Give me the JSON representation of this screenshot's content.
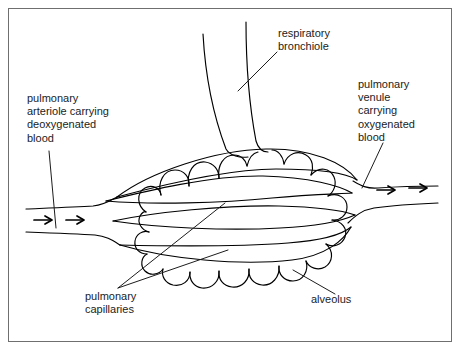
{
  "figure": {
    "style": "hand-drawn line diagram",
    "line_color": "#000000",
    "border_color": "#6f6f6f",
    "background_color": "#ffffff",
    "text_color": "#1c1c1c"
  },
  "labels": {
    "arteriole": "pulmonary\narteriole carrying\ndeoxygenated\nblood",
    "bronchiole": "respiratory\nbronchiole",
    "venule": "pulmonary\nvenule\ncarrying\noxygenated\nblood",
    "capillaries": "pulmonary\ncapillaries",
    "alveolus": "alveolus"
  },
  "flow_arrows": {
    "inflow_count": 2,
    "outflow_count": 2,
    "direction": "right"
  }
}
